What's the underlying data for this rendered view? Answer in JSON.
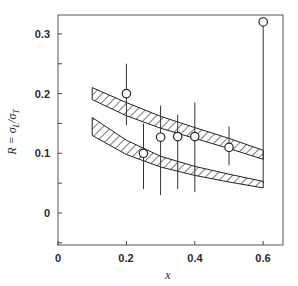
{
  "chart_data": {
    "type": "scatter",
    "title": "",
    "xlabel": "x",
    "ylabel": "R = σL/σT",
    "xlim": [
      0,
      0.66
    ],
    "ylim": [
      -0.055,
      0.33
    ],
    "grid": false,
    "legend": null,
    "x_ticks": [
      0,
      0.2,
      0.4,
      0.6
    ],
    "x_tick_labels": [
      "0",
      "0.2",
      "0.4",
      "0.6"
    ],
    "y_ticks": [
      0,
      0.1,
      0.2,
      0.3
    ],
    "y_tick_labels": [
      "0",
      "0.1",
      "0.2",
      "0.3"
    ],
    "y_minor_ticks": [
      -0.05,
      0.05,
      0.15,
      0.25
    ],
    "series": [
      {
        "name": "data",
        "marker": "open-circle",
        "points": [
          {
            "x": 0.2,
            "y": 0.2,
            "y_low": 0.147,
            "y_high": 0.25
          },
          {
            "x": 0.25,
            "y": 0.1,
            "y_low": 0.04,
            "y_high": 0.15
          },
          {
            "x": 0.3,
            "y": 0.127,
            "y_low": 0.03,
            "y_high": 0.18
          },
          {
            "x": 0.35,
            "y": 0.128,
            "y_low": 0.04,
            "y_high": 0.165
          },
          {
            "x": 0.4,
            "y": 0.128,
            "y_low": 0.035,
            "y_high": 0.185
          },
          {
            "x": 0.5,
            "y": 0.11,
            "y_low": 0.08,
            "y_high": 0.145
          },
          {
            "x": 0.6,
            "y": 0.32,
            "y_low": 0.05,
            "y_high": 0.32
          }
        ]
      }
    ],
    "bands": [
      {
        "name": "upper-hatched-band",
        "x": [
          0.1,
          0.2,
          0.3,
          0.4,
          0.5,
          0.6
        ],
        "upper": [
          0.21,
          0.185,
          0.162,
          0.143,
          0.125,
          0.105
        ],
        "lower": [
          0.19,
          0.163,
          0.142,
          0.125,
          0.108,
          0.09
        ]
      },
      {
        "name": "lower-hatched-band",
        "x": [
          0.1,
          0.2,
          0.3,
          0.4,
          0.5,
          0.6
        ],
        "upper": [
          0.16,
          0.122,
          0.095,
          0.078,
          0.065,
          0.053
        ],
        "lower": [
          0.13,
          0.098,
          0.077,
          0.063,
          0.052,
          0.042
        ]
      }
    ]
  },
  "labels": {
    "xlabel": "x",
    "ylabel_prefix": "R = σ",
    "ylabel_sub1": "L",
    "ylabel_mid": "/σ",
    "ylabel_sub2": "T",
    "xt0": "0",
    "xt1": "0.2",
    "xt2": "0.4",
    "xt3": "0.6",
    "yt0": "0",
    "yt1": "0.1",
    "yt2": "0.2",
    "yt3": "0.3"
  }
}
